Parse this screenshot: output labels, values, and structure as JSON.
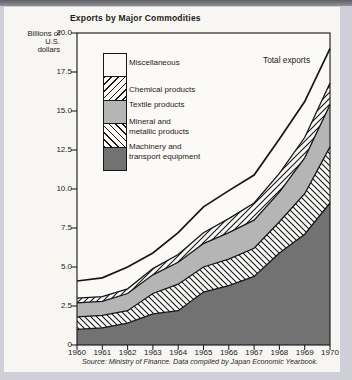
{
  "source": "Source: Ministry of Finance. Data compiled by Japan Economic Yearbook.",
  "colors": {
    "page_bg": "#cfd0d7",
    "card_bg": "#f7f6f2",
    "plot_bg": "#fbfaf7",
    "ink": "#15151a",
    "textile_gray": "#b5b5b5",
    "machinery_gray": "#727272",
    "white_band": "#fbfaf7"
  },
  "chart_data": {
    "type": "area",
    "stacked": true,
    "title": "Exports by Major Commodities",
    "ylabel": "Billions of U.S. dollars",
    "ylabel_lines": [
      "Billions of",
      "U.S.",
      "dollars"
    ],
    "ylim": [
      0,
      20
    ],
    "ytick_step": 2.5,
    "grid": false,
    "legend_position": "inside-top-left",
    "x": [
      1960,
      1961,
      1962,
      1963,
      1964,
      1965,
      1966,
      1967,
      1968,
      1969,
      1970
    ],
    "series": [
      {
        "name": "Machinery and transport equipment",
        "legend_lines": [
          "Machinery and",
          "transport equipment"
        ],
        "pattern": "solid-dark",
        "values": [
          1.0,
          1.1,
          1.4,
          2.0,
          2.2,
          3.4,
          3.8,
          4.4,
          5.9,
          7.1,
          9.1
        ]
      },
      {
        "name": "Mineral and metallic products",
        "legend_lines": [
          "Mineral and",
          "metallic products"
        ],
        "pattern": "hatch-back",
        "values": [
          0.8,
          0.8,
          0.8,
          1.3,
          1.7,
          1.6,
          1.7,
          1.8,
          2.0,
          2.6,
          3.6
        ]
      },
      {
        "name": "Textile products",
        "legend_lines": [
          "Textile products"
        ],
        "pattern": "solid-gray",
        "values": [
          0.9,
          0.9,
          1.1,
          1.2,
          1.4,
          1.5,
          1.7,
          1.8,
          1.9,
          2.3,
          2.7
        ]
      },
      {
        "name": "Chemical products",
        "legend_lines": [
          "Chemical products"
        ],
        "pattern": "hatch-fwd",
        "values": [
          0.3,
          0.3,
          0.3,
          0.4,
          0.5,
          0.7,
          0.9,
          1.1,
          1.2,
          1.3,
          1.4
        ]
      },
      {
        "name": "Miscellaneous",
        "legend_lines": [
          "Miscellaneous"
        ],
        "pattern": "plain-white",
        "values": [
          1.1,
          1.2,
          1.4,
          1.0,
          1.4,
          1.65,
          1.8,
          1.8,
          2.2,
          2.3,
          2.2
        ]
      }
    ],
    "total": {
      "label": "Total exports",
      "values": [
        4.1,
        4.3,
        5.0,
        5.9,
        7.2,
        8.85,
        9.9,
        10.9,
        13.2,
        15.6,
        19.0
      ]
    }
  }
}
